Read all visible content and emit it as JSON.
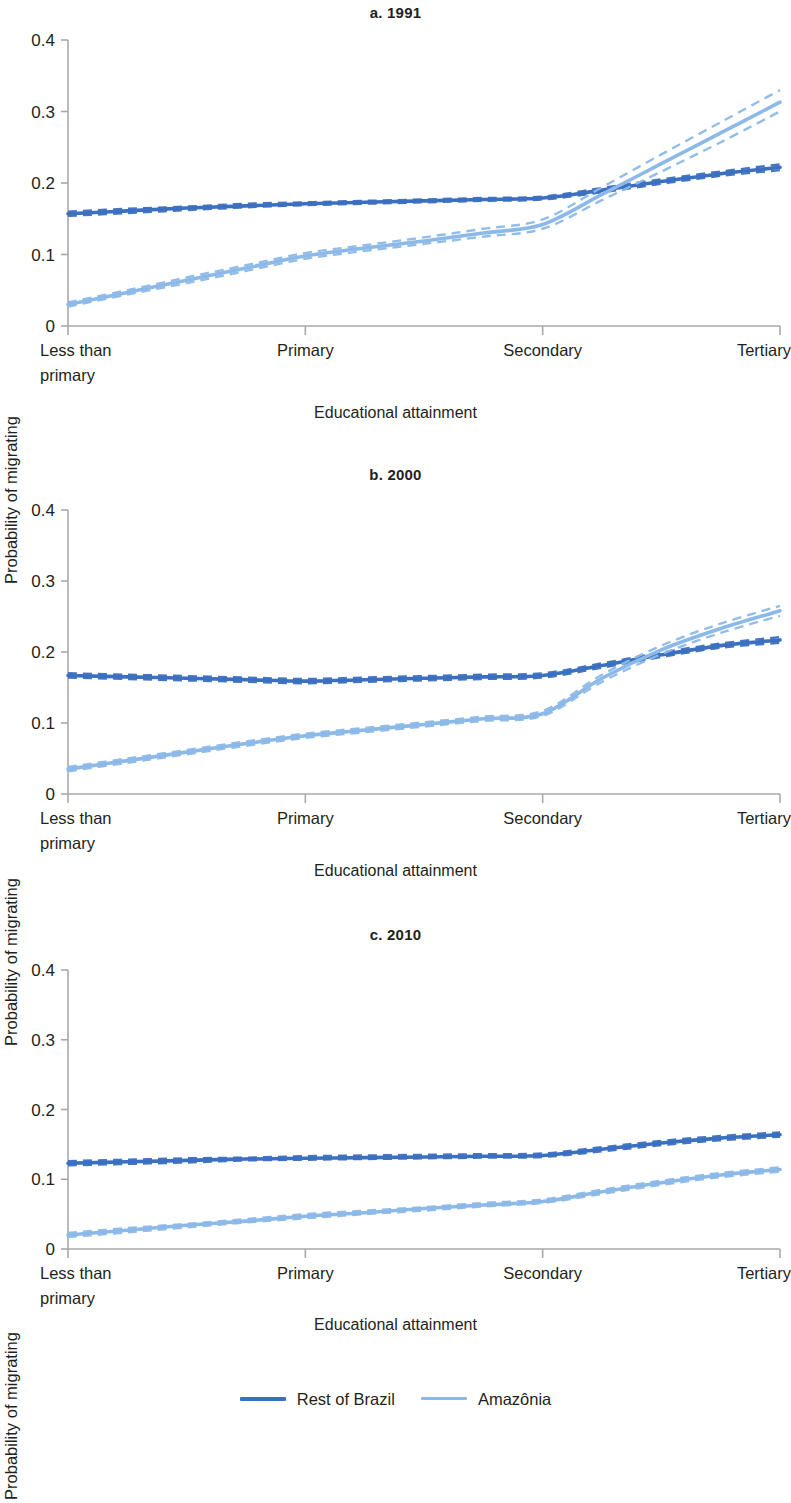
{
  "figure": {
    "panels": [
      {
        "id": "a",
        "title": "a. 1991"
      },
      {
        "id": "b",
        "title": "b. 2000"
      },
      {
        "id": "c",
        "title": "c. 2010"
      }
    ],
    "axis": {
      "ylabel": "Probability of migrating",
      "xlabel": "Educational attainment",
      "yticks": [
        "0",
        "0.1",
        "0.2",
        "0.3",
        "0.4"
      ],
      "xticks": [
        "Less than\nprimary",
        "Primary",
        "Secondary",
        "Tertiary"
      ],
      "xtick_line1": [
        "Less than",
        "Primary",
        "Secondary",
        "Tertiary"
      ],
      "xtick_line2": [
        "primary",
        "",
        "",
        ""
      ]
    },
    "legend": {
      "items": [
        {
          "label": "Rest of Brazil",
          "color": "#3b6fc0",
          "style": "solid"
        },
        {
          "label": "Amazônia",
          "color": "#8cb9e8",
          "style": "solid"
        }
      ]
    },
    "colors": {
      "rest_of_brazil": "#3b6fc0",
      "amazonia": "#8cb9e8",
      "axis": "#a7a9ac",
      "text": "#231f20"
    }
  },
  "chart_data": [
    {
      "type": "line",
      "title": "a. 1991",
      "xlabel": "Educational attainment",
      "ylabel": "Probability of migrating",
      "categories": [
        "Less than primary",
        "Primary",
        "Secondary",
        "Tertiary"
      ],
      "x": [
        0,
        1,
        2,
        3
      ],
      "xlim": [
        0,
        3
      ],
      "ylim": [
        0,
        0.4
      ],
      "yticks": [
        0,
        0.1,
        0.2,
        0.3,
        0.4
      ],
      "grid": false,
      "legend_position": "bottom-figure",
      "series": [
        {
          "name": "Rest of Brazil",
          "color": "#3b6fc0",
          "values": [
            0.157,
            0.171,
            0.178,
            0.222
          ],
          "x_dense": [
            0,
            0.25,
            0.5,
            0.75,
            1,
            1.25,
            1.5,
            1.75,
            2,
            2.25,
            2.5,
            2.75,
            3
          ],
          "y_dense": [
            0.157,
            0.161,
            0.165,
            0.168,
            0.171,
            0.173,
            0.175,
            0.177,
            0.179,
            0.19,
            0.202,
            0.213,
            0.222
          ],
          "ci_upper": [
            0.16,
            0.164,
            0.167,
            0.171,
            0.173,
            0.175,
            0.177,
            0.179,
            0.181,
            0.193,
            0.205,
            0.216,
            0.226
          ],
          "ci_lower": [
            0.154,
            0.158,
            0.162,
            0.166,
            0.169,
            0.171,
            0.173,
            0.175,
            0.177,
            0.187,
            0.199,
            0.21,
            0.218
          ]
        },
        {
          "name": "Amazônia",
          "color": "#8cb9e8",
          "values": [
            0.03,
            0.098,
            0.142,
            0.313
          ],
          "x_dense": [
            0,
            0.25,
            0.5,
            0.75,
            1,
            1.25,
            1.5,
            1.75,
            2,
            2.25,
            2.5,
            2.75,
            3
          ],
          "y_dense": [
            0.03,
            0.047,
            0.064,
            0.081,
            0.098,
            0.109,
            0.119,
            0.13,
            0.142,
            0.184,
            0.227,
            0.27,
            0.313
          ],
          "ci_upper": [
            0.033,
            0.05,
            0.068,
            0.085,
            0.102,
            0.113,
            0.124,
            0.136,
            0.149,
            0.194,
            0.24,
            0.285,
            0.33
          ],
          "ci_lower": [
            0.027,
            0.044,
            0.06,
            0.077,
            0.094,
            0.105,
            0.115,
            0.125,
            0.136,
            0.176,
            0.216,
            0.257,
            0.3
          ]
        }
      ],
      "crossover": {
        "x": 2.17,
        "y": 0.189
      }
    },
    {
      "type": "line",
      "title": "b. 2000",
      "xlabel": "Educational attainment",
      "ylabel": "Probability of migrating",
      "categories": [
        "Less than primary",
        "Primary",
        "Secondary",
        "Tertiary"
      ],
      "x": [
        0,
        1,
        2,
        3
      ],
      "xlim": [
        0,
        3
      ],
      "ylim": [
        0,
        0.4
      ],
      "yticks": [
        0,
        0.1,
        0.2,
        0.3,
        0.4
      ],
      "grid": false,
      "legend_position": "bottom-figure",
      "series": [
        {
          "name": "Rest of Brazil",
          "color": "#3b6fc0",
          "values": [
            0.167,
            0.159,
            0.167,
            0.217
          ],
          "x_dense": [
            0,
            0.25,
            0.5,
            0.75,
            1,
            1.25,
            1.5,
            1.75,
            2,
            2.25,
            2.5,
            2.75,
            3
          ],
          "y_dense": [
            0.167,
            0.165,
            0.163,
            0.161,
            0.159,
            0.161,
            0.163,
            0.165,
            0.167,
            0.181,
            0.196,
            0.209,
            0.217
          ],
          "ci_upper": [
            0.17,
            0.168,
            0.166,
            0.164,
            0.162,
            0.164,
            0.166,
            0.168,
            0.17,
            0.184,
            0.199,
            0.212,
            0.221
          ],
          "ci_lower": [
            0.164,
            0.162,
            0.16,
            0.158,
            0.156,
            0.158,
            0.16,
            0.162,
            0.164,
            0.178,
            0.193,
            0.206,
            0.213
          ]
        },
        {
          "name": "Amazônia",
          "color": "#8cb9e8",
          "values": [
            0.035,
            0.082,
            0.113,
            0.258
          ],
          "x_dense": [
            0,
            0.25,
            0.5,
            0.75,
            1,
            1.25,
            1.5,
            1.75,
            2,
            2.25,
            2.5,
            2.75,
            3
          ],
          "y_dense": [
            0.035,
            0.047,
            0.059,
            0.071,
            0.082,
            0.09,
            0.098,
            0.106,
            0.113,
            0.163,
            0.203,
            0.233,
            0.258
          ],
          "ci_upper": [
            0.038,
            0.05,
            0.062,
            0.074,
            0.085,
            0.093,
            0.101,
            0.109,
            0.117,
            0.168,
            0.209,
            0.24,
            0.265
          ],
          "ci_lower": [
            0.032,
            0.044,
            0.056,
            0.068,
            0.079,
            0.087,
            0.095,
            0.103,
            0.11,
            0.158,
            0.197,
            0.227,
            0.251
          ]
        }
      ],
      "crossover": {
        "x": 2.45,
        "y": 0.194
      }
    },
    {
      "type": "line",
      "title": "c. 2010",
      "xlabel": "Educational attainment",
      "ylabel": "Probability of migrating",
      "categories": [
        "Less than primary",
        "Primary",
        "Secondary",
        "Tertiary"
      ],
      "x": [
        0,
        1,
        2,
        3
      ],
      "xlim": [
        0,
        3
      ],
      "ylim": [
        0,
        0.4
      ],
      "yticks": [
        0,
        0.1,
        0.2,
        0.3,
        0.4
      ],
      "grid": false,
      "legend_position": "bottom-figure",
      "series": [
        {
          "name": "Rest of Brazil",
          "color": "#3b6fc0",
          "values": [
            0.123,
            0.13,
            0.134,
            0.164
          ],
          "x_dense": [
            0,
            0.25,
            0.5,
            0.75,
            1,
            1.25,
            1.5,
            1.75,
            2,
            2.25,
            2.5,
            2.75,
            3
          ],
          "y_dense": [
            0.123,
            0.125,
            0.127,
            0.129,
            0.13,
            0.131,
            0.132,
            0.133,
            0.134,
            0.143,
            0.152,
            0.159,
            0.164
          ],
          "ci_upper": [
            0.126,
            0.128,
            0.13,
            0.131,
            0.133,
            0.134,
            0.135,
            0.136,
            0.137,
            0.146,
            0.155,
            0.162,
            0.167
          ],
          "ci_lower": [
            0.12,
            0.122,
            0.124,
            0.127,
            0.128,
            0.129,
            0.13,
            0.131,
            0.132,
            0.14,
            0.149,
            0.156,
            0.161
          ]
        },
        {
          "name": "Amazônia",
          "color": "#8cb9e8",
          "values": [
            0.02,
            0.047,
            0.068,
            0.114
          ],
          "x_dense": [
            0,
            0.25,
            0.5,
            0.75,
            1,
            1.25,
            1.5,
            1.75,
            2,
            2.25,
            2.5,
            2.75,
            3
          ],
          "y_dense": [
            0.02,
            0.027,
            0.034,
            0.04,
            0.047,
            0.052,
            0.058,
            0.063,
            0.068,
            0.082,
            0.095,
            0.106,
            0.114
          ],
          "ci_upper": [
            0.023,
            0.03,
            0.036,
            0.043,
            0.05,
            0.055,
            0.06,
            0.066,
            0.071,
            0.085,
            0.098,
            0.109,
            0.117
          ],
          "ci_lower": [
            0.017,
            0.024,
            0.031,
            0.038,
            0.044,
            0.05,
            0.055,
            0.061,
            0.066,
            0.079,
            0.092,
            0.103,
            0.111
          ]
        }
      ],
      "crossover": null
    }
  ]
}
